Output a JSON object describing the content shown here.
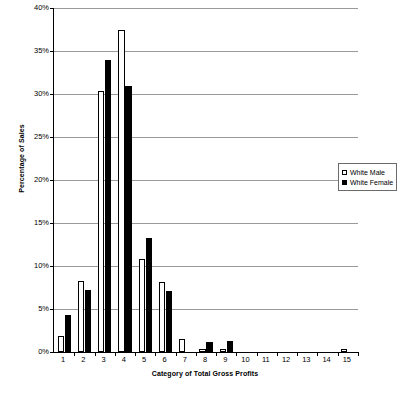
{
  "chart_data": {
    "type": "bar",
    "title": "",
    "xlabel": "Category of Total Gross Profits",
    "ylabel": "Percentage of Sales",
    "categories": [
      "1",
      "2",
      "3",
      "4",
      "5",
      "6",
      "7",
      "8",
      "9",
      "10",
      "11",
      "12",
      "13",
      "14",
      "15"
    ],
    "ylim": [
      0,
      40
    ],
    "ytick_labels": [
      "0%",
      "5%",
      "10%",
      "15%",
      "20%",
      "25%",
      "30%",
      "35%",
      "40%"
    ],
    "ytick_values": [
      0,
      5,
      10,
      15,
      20,
      25,
      30,
      35,
      40
    ],
    "grid": true,
    "legend_position": "right",
    "series": [
      {
        "name": "White Male",
        "color": "#ffffff",
        "edge_color": "#000000",
        "values": [
          1.9,
          8.2,
          30.4,
          37.5,
          10.8,
          8.1,
          1.5,
          0.3,
          0.4,
          0.0,
          0.0,
          0.0,
          0.0,
          0.0,
          0.4
        ]
      },
      {
        "name": "White Female",
        "color": "#000000",
        "edge_color": "#000000",
        "values": [
          4.3,
          7.2,
          33.9,
          30.9,
          13.2,
          7.1,
          0.0,
          1.2,
          1.3,
          0.0,
          0.0,
          0.0,
          0.0,
          0.0,
          0.0
        ]
      }
    ]
  },
  "legend": {
    "items": [
      {
        "label": "White Male",
        "swatch": "open-square"
      },
      {
        "label": "White Female",
        "swatch": "filled-square"
      }
    ]
  },
  "axes": {
    "y_title": "Percentage of Sales",
    "x_title": "Category of Total Gross Profits"
  }
}
